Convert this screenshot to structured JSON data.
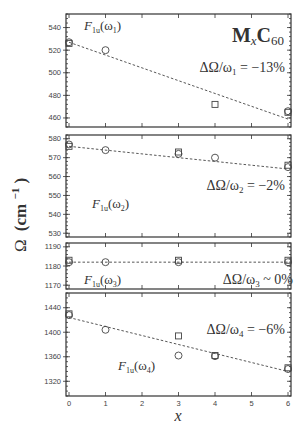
{
  "chart_data": {
    "type": "scatter",
    "title_display": {
      "main": "M",
      "sub1": "x",
      "main2": "C",
      "sub2": "60"
    },
    "xlabel": "x",
    "ylabel": "Ω (cm⁻¹)",
    "ylabel_display": {
      "omega": "Ω",
      "unit": "(cm",
      "exp": "−1",
      "close": ")"
    },
    "xlim": [
      0,
      6
    ],
    "xticks": [
      0,
      1,
      2,
      3,
      4,
      5,
      6
    ],
    "grid": false,
    "legend": "none",
    "panels": [
      {
        "mode": "F1u(ω1)",
        "mode_display": {
          "F": "F",
          "sub": "1u",
          "arg": "(ω",
          "argsub": "1",
          "close": ")"
        },
        "annotation": "ΔΩ/ω1 = −13%",
        "annotation_display": {
          "pre": "ΔΩ/ω",
          "sub": "1",
          "post": " = −13%"
        },
        "ylim": [
          452,
          552
        ],
        "yticks": [
          460,
          480,
          500,
          520,
          540
        ],
        "fit": {
          "x": [
            0,
            6
          ],
          "y": [
            527,
            459
          ]
        },
        "circles": {
          "x": [
            0,
            1,
            6
          ],
          "y": [
            527,
            520,
            466
          ]
        },
        "squares": {
          "x": [
            0,
            4,
            6
          ],
          "y": [
            526,
            472,
            465
          ]
        }
      },
      {
        "mode": "F1u(ω2)",
        "mode_display": {
          "F": "F",
          "sub": "1u",
          "arg": "(ω",
          "argsub": "2",
          "close": ")"
        },
        "annotation": "ΔΩ/ω2 = −2%",
        "annotation_display": {
          "pre": "ΔΩ/ω",
          "sub": "2",
          "post": " = −2%"
        },
        "ylim": [
          528,
          582
        ],
        "yticks": [
          530,
          540,
          550,
          560,
          570,
          580
        ],
        "fit": {
          "x": [
            0,
            6
          ],
          "y": [
            576,
            564
          ]
        },
        "circles": {
          "x": [
            0,
            1,
            3,
            4,
            6
          ],
          "y": [
            577,
            574,
            572,
            570,
            565
          ]
        },
        "squares": {
          "x": [
            0,
            3,
            6
          ],
          "y": [
            576,
            573,
            566
          ]
        }
      },
      {
        "mode": "F1u(ω3)",
        "mode_display": {
          "F": "F",
          "sub": "1u",
          "arg": "(ω",
          "argsub": "3",
          "close": ")"
        },
        "annotation": "ΔΩ/ω3 ~ 0%",
        "annotation_display": {
          "pre": "ΔΩ/ω",
          "sub": "3",
          "post": " ~ 0%"
        },
        "ylim": [
          1168,
          1192
        ],
        "yticks": [
          1170,
          1180,
          1190
        ],
        "fit": {
          "x": [
            0,
            6
          ],
          "y": [
            1182,
            1182
          ]
        },
        "circles": {
          "x": [
            0,
            1,
            3,
            6
          ],
          "y": [
            1182,
            1182,
            1182,
            1182
          ]
        },
        "squares": {
          "x": [
            0,
            3,
            6
          ],
          "y": [
            1183,
            1183,
            1183
          ]
        }
      },
      {
        "mode": "F1u(ω4)",
        "mode_display": {
          "F": "F",
          "sub": "1u",
          "arg": "(ω",
          "argsub": "4",
          "close": ")"
        },
        "annotation": "ΔΩ/ω4 = −6%",
        "annotation_display": {
          "pre": "ΔΩ/ω",
          "sub": "4",
          "post": " = −6%"
        },
        "ylim": [
          1296,
          1464
        ],
        "yticks": [
          1320,
          1360,
          1400,
          1440
        ],
        "fit": {
          "x": [
            0,
            6
          ],
          "y": [
            1424,
            1336
          ]
        },
        "circles": {
          "x": [
            0,
            1,
            3,
            4,
            6
          ],
          "y": [
            1428,
            1404,
            1362,
            1361,
            1340
          ]
        },
        "squares": {
          "x": [
            0,
            3,
            4,
            6
          ],
          "y": [
            1430,
            1394,
            1362,
            1342
          ]
        }
      }
    ]
  }
}
